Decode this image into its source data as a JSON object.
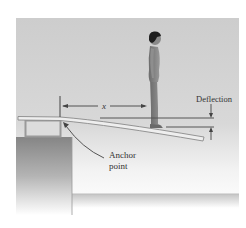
{
  "diagram": {
    "type": "physics-illustration",
    "labels": {
      "distance_variable": "x",
      "deflection": "Deflection",
      "anchor_line1": "Anchor",
      "anchor_line2": "point"
    },
    "elements": [
      "diving-board",
      "anchor-point",
      "support-stand",
      "pedestal",
      "diver",
      "water-surface",
      "distance-arrow",
      "deflection-markers"
    ],
    "colors": {
      "background_panel": "#cfcfcf",
      "board": "#e6e6e6",
      "board_outline": "#8a8a8a",
      "pedestal": "#8c8c8c",
      "diver": "#7a7a7a",
      "hair": "#1e1e1e",
      "line": "#555555",
      "water": "#c8c8c8"
    }
  }
}
